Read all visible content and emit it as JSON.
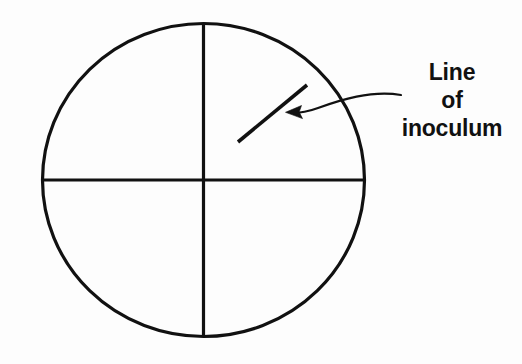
{
  "figure": {
    "type": "diagram",
    "background_color": "#fdfdfd",
    "stroke_color": "#111111",
    "plate": {
      "name": "petri-dish-outline",
      "shape": "circle",
      "center_x": 203.5,
      "center_y": 180,
      "radius_x": 162,
      "radius_y": 157,
      "stroke_width": 3
    },
    "dividers": [
      {
        "name": "vertical-divider",
        "orientation": "vertical",
        "x1": 203.5,
        "y1": 23,
        "x2": 203.5,
        "y2": 337,
        "stroke_width": 3
      },
      {
        "name": "horizontal-divider",
        "orientation": "horizontal",
        "x1": 42,
        "y1": 180,
        "x2": 365,
        "y2": 180,
        "stroke_width": 3
      }
    ],
    "inoculum_line": {
      "name": "line-of-inoculum",
      "x1": 238,
      "y1": 142,
      "x2": 307,
      "y2": 85,
      "stroke_width": 3.4
    },
    "leader": {
      "name": "leader-arrow",
      "path": "M 400 96 C 372 92, 336 102, 314 110 C 307 112, 298 113, 290 113",
      "stroke_width": 2,
      "arrow_tip_x": 286,
      "arrow_tip_y": 112.5
    },
    "label": {
      "name": "line-of-inoculum-label",
      "align": "center",
      "lines": [
        "Line",
        "of",
        "inoculum"
      ]
    }
  }
}
